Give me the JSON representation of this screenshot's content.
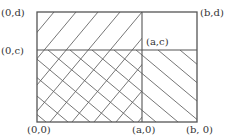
{
  "diagram": {
    "labels": {
      "top_left": "(0,d)",
      "top_right": "(b,d)",
      "mid_left": "(0,c)",
      "mid_inner": "(a,c)",
      "bottom_left": "(0,0)",
      "bottom_mid": "(a,0)",
      "bottom_right": "(b, 0)"
    },
    "regions": [
      {
        "name": "[0,a]x[0,d]",
        "hatch": "forward-slash"
      },
      {
        "name": "[0,b]x[0,c]",
        "hatch": "back-slash"
      },
      {
        "name": "[a,b]x[c,d]",
        "hatch": "none"
      }
    ],
    "colors": {
      "line": "#555555",
      "hatch": "#555555",
      "text": "#333333"
    }
  }
}
